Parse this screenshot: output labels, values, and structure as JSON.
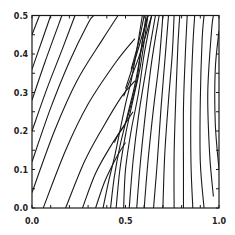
{
  "chart_data": {
    "type": "line",
    "title": "",
    "xlabel": "",
    "ylabel": "",
    "xlim": [
      0.0,
      1.0
    ],
    "ylim": [
      0.0,
      0.5
    ],
    "grid": false,
    "legend": null,
    "x_ticks": [
      "0.0",
      "0.5",
      "1.0"
    ],
    "y_ticks": [
      "0.0",
      "0.1",
      "0.2",
      "0.3",
      "0.4",
      "0.5"
    ],
    "left_family": [
      [
        [
          0.0,
          0.45
        ],
        [
          0.04,
          0.5
        ]
      ],
      [
        [
          0.0,
          0.36
        ],
        [
          0.05,
          0.43
        ],
        [
          0.1,
          0.5
        ]
      ],
      [
        [
          0.0,
          0.28
        ],
        [
          0.07,
          0.38
        ],
        [
          0.16,
          0.5
        ]
      ],
      [
        [
          0.0,
          0.2
        ],
        [
          0.08,
          0.31
        ],
        [
          0.16,
          0.41
        ],
        [
          0.23,
          0.5
        ]
      ],
      [
        [
          0.0,
          0.12
        ],
        [
          0.1,
          0.26
        ],
        [
          0.2,
          0.38
        ],
        [
          0.3,
          0.48
        ],
        [
          0.33,
          0.5
        ]
      ],
      [
        [
          0.0,
          0.04
        ],
        [
          0.12,
          0.2
        ],
        [
          0.24,
          0.33
        ],
        [
          0.38,
          0.44
        ],
        [
          0.46,
          0.5
        ]
      ],
      [
        [
          0.06,
          0.0
        ],
        [
          0.18,
          0.15
        ],
        [
          0.3,
          0.27
        ],
        [
          0.45,
          0.38
        ],
        [
          0.55,
          0.44
        ]
      ],
      [
        [
          0.18,
          0.0
        ],
        [
          0.28,
          0.12
        ],
        [
          0.38,
          0.21
        ],
        [
          0.48,
          0.29
        ],
        [
          0.55,
          0.33
        ]
      ],
      [
        [
          0.27,
          0.0
        ],
        [
          0.34,
          0.09
        ],
        [
          0.42,
          0.16
        ],
        [
          0.5,
          0.22
        ],
        [
          0.54,
          0.25
        ]
      ],
      [
        [
          0.34,
          0.0
        ],
        [
          0.39,
          0.07
        ],
        [
          0.45,
          0.13
        ],
        [
          0.5,
          0.17
        ]
      ]
    ],
    "shock_front": [
      [
        0.44,
        0.17
      ],
      [
        0.46,
        0.19
      ],
      [
        0.5,
        0.22
      ],
      [
        0.53,
        0.27
      ],
      [
        0.56,
        0.33
      ],
      [
        0.58,
        0.4
      ],
      [
        0.6,
        0.46
      ],
      [
        0.62,
        0.5
      ]
    ],
    "right_family": [
      [
        [
          0.38,
          0.0
        ],
        [
          0.41,
          0.07
        ],
        [
          0.44,
          0.13
        ],
        [
          0.47,
          0.2
        ],
        [
          0.5,
          0.27
        ],
        [
          0.53,
          0.33
        ],
        [
          0.56,
          0.41
        ],
        [
          0.59,
          0.5
        ]
      ],
      [
        [
          0.42,
          0.0
        ],
        [
          0.44,
          0.08
        ],
        [
          0.47,
          0.16
        ],
        [
          0.51,
          0.24
        ],
        [
          0.55,
          0.32
        ],
        [
          0.58,
          0.4
        ],
        [
          0.61,
          0.5
        ]
      ],
      [
        [
          0.45,
          0.0
        ],
        [
          0.47,
          0.1
        ],
        [
          0.5,
          0.19
        ],
        [
          0.54,
          0.28
        ],
        [
          0.58,
          0.37
        ],
        [
          0.62,
          0.5
        ]
      ],
      [
        [
          0.49,
          0.0
        ],
        [
          0.5,
          0.1
        ],
        [
          0.53,
          0.2
        ],
        [
          0.57,
          0.3
        ],
        [
          0.6,
          0.4
        ],
        [
          0.64,
          0.5
        ]
      ],
      [
        [
          0.52,
          0.0
        ],
        [
          0.54,
          0.12
        ],
        [
          0.57,
          0.24
        ],
        [
          0.61,
          0.36
        ],
        [
          0.66,
          0.5
        ]
      ],
      [
        [
          0.56,
          0.0
        ],
        [
          0.58,
          0.12
        ],
        [
          0.61,
          0.26
        ],
        [
          0.64,
          0.38
        ],
        [
          0.68,
          0.5
        ]
      ],
      [
        [
          0.6,
          0.0
        ],
        [
          0.62,
          0.12
        ],
        [
          0.65,
          0.26
        ],
        [
          0.68,
          0.38
        ],
        [
          0.7,
          0.5
        ]
      ],
      [
        [
          0.65,
          0.0
        ],
        [
          0.67,
          0.12
        ],
        [
          0.69,
          0.26
        ],
        [
          0.71,
          0.38
        ],
        [
          0.73,
          0.5
        ]
      ],
      [
        [
          0.7,
          0.0
        ],
        [
          0.71,
          0.14
        ],
        [
          0.73,
          0.28
        ],
        [
          0.75,
          0.4
        ],
        [
          0.76,
          0.5
        ]
      ],
      [
        [
          0.76,
          0.0
        ],
        [
          0.76,
          0.14
        ],
        [
          0.77,
          0.3
        ],
        [
          0.78,
          0.42
        ],
        [
          0.79,
          0.5
        ]
      ],
      [
        [
          0.81,
          0.0
        ],
        [
          0.81,
          0.1
        ],
        [
          0.81,
          0.26
        ],
        [
          0.82,
          0.4
        ],
        [
          0.83,
          0.5
        ]
      ],
      [
        [
          0.86,
          0.0
        ],
        [
          0.85,
          0.12
        ],
        [
          0.85,
          0.28
        ],
        [
          0.86,
          0.42
        ],
        [
          0.87,
          0.5
        ]
      ],
      [
        [
          0.92,
          0.0
        ],
        [
          0.9,
          0.12
        ],
        [
          0.9,
          0.28
        ],
        [
          0.91,
          0.44
        ],
        [
          0.92,
          0.5
        ]
      ],
      [
        [
          0.97,
          0.03
        ],
        [
          0.95,
          0.14
        ],
        [
          0.94,
          0.3
        ],
        [
          0.96,
          0.46
        ],
        [
          0.97,
          0.5
        ]
      ],
      [
        [
          1.0,
          0.1
        ],
        [
          0.98,
          0.22
        ],
        [
          0.98,
          0.36
        ],
        [
          1.0,
          0.46
        ]
      ]
    ],
    "fan_from_top": [
      [
        [
          0.6,
          0.5
        ],
        [
          0.57,
          0.43
        ],
        [
          0.53,
          0.36
        ]
      ],
      [
        [
          0.62,
          0.5
        ],
        [
          0.56,
          0.4
        ],
        [
          0.5,
          0.31
        ]
      ],
      [
        [
          0.64,
          0.5
        ],
        [
          0.57,
          0.39
        ],
        [
          0.49,
          0.29
        ]
      ]
    ]
  }
}
